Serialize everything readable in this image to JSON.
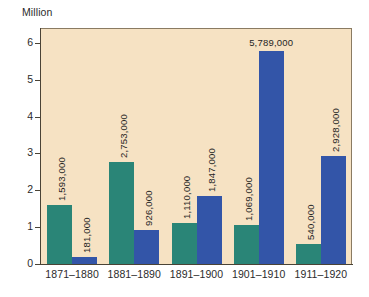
{
  "chart_data": {
    "type": "bar",
    "title": "",
    "subtitle": "",
    "xlabel": "",
    "ylabel": "Million",
    "unit_caption": "Million",
    "ylim": [
      0,
      6.4
    ],
    "yticks": [
      0,
      1,
      2,
      3,
      4,
      5,
      6
    ],
    "ytick_labels": [
      "0",
      "1",
      "2",
      "3",
      "4",
      "5",
      "6"
    ],
    "grid": false,
    "legend": "none",
    "categories": [
      "1871–1880",
      "1881–1890",
      "1891–1900",
      "1901–1910",
      "1911–1920"
    ],
    "series": [
      {
        "name": "series-teal",
        "color": "#2a8577",
        "values": [
          1593000,
          2753000,
          1110000,
          1069000,
          540000
        ],
        "value_labels": [
          "1,593,000",
          "2,753,000",
          "1,110,000",
          "1,069,000",
          "540,000"
        ]
      },
      {
        "name": "series-blue",
        "color": "#3355a8",
        "values": [
          181000,
          926000,
          1847000,
          5789000,
          2928000
        ],
        "value_labels": [
          "181,000",
          "926,000",
          "1,847,000",
          "5,789,000",
          "2,928,000"
        ]
      }
    ],
    "colors": {
      "plot_background": "#f6e2c3",
      "page_background": "#ffffff",
      "axis": "#4a4336",
      "teal": "#2a8577",
      "blue": "#3355a8",
      "text": "#2b2b2b"
    }
  }
}
